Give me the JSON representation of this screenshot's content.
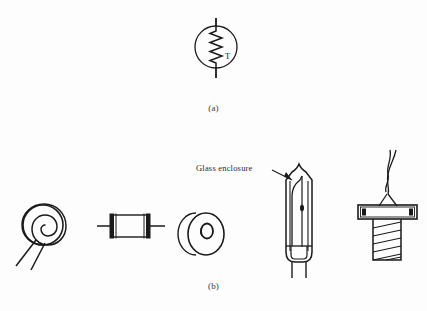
{
  "figure": {
    "background_color": "#fdfdfd",
    "ink_color": "#1a1a1a",
    "panels": [
      {
        "id": "a",
        "caption": "(a)",
        "description": "thermistor-circuit-symbol",
        "symbol": {
          "name": "thermistor-symbol",
          "element_label": "T",
          "circle_center_x": 216,
          "circle_center_y": 47,
          "circle_radius": 21,
          "lead_top_y": 18,
          "lead_bottom_y": 78
        }
      },
      {
        "id": "b",
        "caption": "(b)",
        "description": "thermistor-physical-forms",
        "annotation": {
          "label": "Glass enclosure",
          "target": "glass-probe-tip"
        },
        "components": [
          {
            "name": "disc-spiral-thermistor",
            "leads": 2
          },
          {
            "name": "rod-thermistor",
            "leads": 2
          },
          {
            "name": "washer-thermistor",
            "leads": 0
          },
          {
            "name": "glass-probe-thermistor",
            "leads": 2
          },
          {
            "name": "bolt-mounted-thermistor",
            "leads": 2
          }
        ]
      }
    ]
  },
  "annotations": {
    "glass_enclosure": "Glass enclosure"
  },
  "captions": {
    "panel_a": "(a)",
    "panel_b": "(b)"
  }
}
